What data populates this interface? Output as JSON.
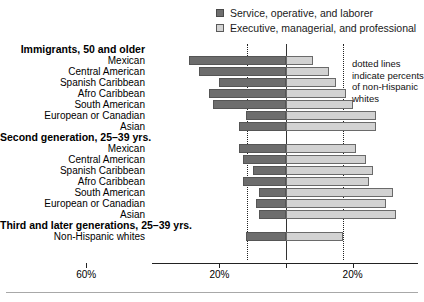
{
  "legend": {
    "items": [
      {
        "label": "Service, operative, and laborer",
        "swatch": "dark",
        "color": "#6e6e6e"
      },
      {
        "label": "Executive, managerial, and professional",
        "swatch": "light",
        "color": "#d4d4d4"
      }
    ]
  },
  "annotation": {
    "line1": "dotted lines",
    "line2": "indicate percents",
    "line3": "of non-Hispanic",
    "line4": "whites"
  },
  "axis": {
    "ticks": [
      {
        "label": "60%",
        "value": -60
      },
      {
        "label": "20%",
        "value": -20
      },
      {
        "label": "",
        "value": 0
      },
      {
        "label": "20%",
        "value": 20
      },
      {
        "label": "60%",
        "value": 60
      }
    ]
  },
  "chart_data": {
    "type": "bar",
    "title": "",
    "subtitle": "",
    "xlabel": "",
    "ylabel": "",
    "orientation": "horizontal",
    "layout": "diverging-bidirectional",
    "xlim": [
      -70,
      70
    ],
    "grid": false,
    "legend_position": "top-right",
    "series": [
      {
        "name": "Service, operative, and laborer",
        "direction": "left",
        "color": "#6e6e6e"
      },
      {
        "name": "Executive, managerial, and professional",
        "direction": "right",
        "color": "#d4d4d4"
      }
    ],
    "reference_lines": [
      {
        "label": "non-Hispanic whites service/operative/laborer",
        "value": -12,
        "style": "dotted"
      },
      {
        "label": "non-Hispanic whites executive/managerial/professional",
        "value": 17,
        "style": "dotted"
      }
    ],
    "groups": [
      {
        "group_label": "Immigrants, 50 and older",
        "rows": [
          {
            "category": "Mexican",
            "service": 29,
            "executive": 8
          },
          {
            "category": "Central American",
            "service": 26,
            "executive": 13
          },
          {
            "category": "Spanish Caribbean",
            "service": 20,
            "executive": 15
          },
          {
            "category": "Afro Caribbean",
            "service": 23,
            "executive": 18
          },
          {
            "category": "South American",
            "service": 22,
            "executive": 20
          },
          {
            "category": "European or Canadian",
            "service": 12,
            "executive": 27
          },
          {
            "category": "Asian",
            "service": 14,
            "executive": 27
          }
        ]
      },
      {
        "group_label": "Second generation, 25–39 yrs.",
        "rows": [
          {
            "category": "Mexican",
            "service": 14,
            "executive": 21
          },
          {
            "category": "Central American",
            "service": 13,
            "executive": 24
          },
          {
            "category": "Spanish Caribbean",
            "service": 10,
            "executive": 26
          },
          {
            "category": "Afro Caribbean",
            "service": 13,
            "executive": 25
          },
          {
            "category": "South American",
            "service": 8,
            "executive": 32
          },
          {
            "category": "European or Canadian",
            "service": 9,
            "executive": 30
          },
          {
            "category": "Asian",
            "service": 8,
            "executive": 33
          }
        ]
      },
      {
        "group_label": "Third and later generations, 25–39 yrs.",
        "rows": [
          {
            "category": "Non-Hispanic whites",
            "service": 12,
            "executive": 17
          }
        ]
      }
    ]
  }
}
